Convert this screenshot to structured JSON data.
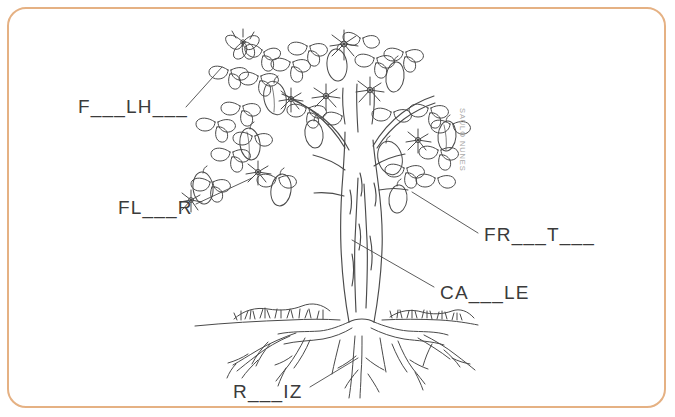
{
  "page": {
    "background_color": "#ffffff",
    "border_color": "#e5b183",
    "ink_color": "#3b3b3b",
    "width": 675,
    "height": 417
  },
  "watermark": {
    "text": "SAULO NUNES",
    "color": "#a9a9a9"
  },
  "labels": [
    {
      "id": "folha",
      "text": "F___LH___",
      "answer": "FOLHA",
      "part": "leaf",
      "x": 78,
      "y": 97
    },
    {
      "id": "flor",
      "text": "FL___R",
      "answer": "FLOR",
      "part": "flower",
      "x": 118,
      "y": 198
    },
    {
      "id": "fruto",
      "text": "FR___T___",
      "answer": "FRUTO",
      "part": "fruit",
      "x": 484,
      "y": 225
    },
    {
      "id": "caule",
      "text": "CA___LE",
      "answer": "CAULE",
      "part": "trunk",
      "x": 440,
      "y": 283
    },
    {
      "id": "raiz",
      "text": "R___IZ",
      "answer": "RAIZ",
      "part": "root",
      "x": 233,
      "y": 382
    }
  ],
  "illustration": {
    "name": "line-art-tree",
    "style": "black-and-white outline coloring drawing",
    "elements": [
      "canopy-leaves",
      "flowers",
      "fruits",
      "trunk",
      "ground-line",
      "grass-tufts",
      "roots"
    ],
    "ground_line_y": 322
  },
  "leader_lines": [
    {
      "for": "folha",
      "from": [
        186,
        107
      ],
      "to": [
        222,
        67
      ]
    },
    {
      "for": "flor",
      "from": [
        196,
        204
      ],
      "to": [
        252,
        178
      ]
    },
    {
      "for": "fruto",
      "from": [
        478,
        233
      ],
      "to": [
        412,
        192
      ]
    },
    {
      "for": "caule",
      "from": [
        434,
        287
      ],
      "to": [
        352,
        240
      ]
    },
    {
      "for": "raiz",
      "from": [
        310,
        387
      ],
      "to": [
        358,
        358
      ]
    }
  ]
}
